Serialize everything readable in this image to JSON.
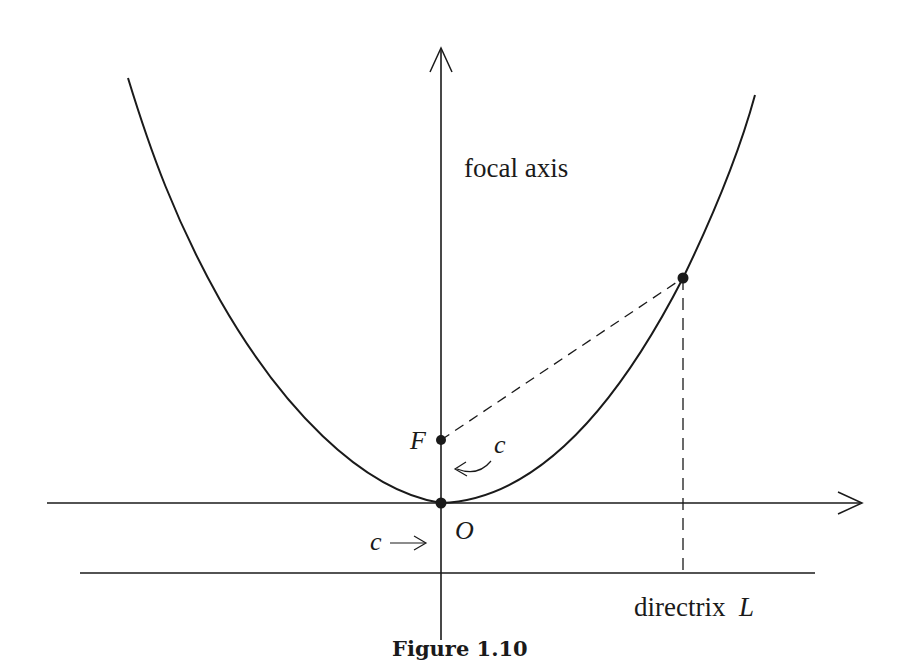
{
  "figure": {
    "caption": "Figure 1.10",
    "labels": {
      "focal_axis": "focal axis",
      "focus": "F",
      "origin": "O",
      "directrix": "directrix",
      "directrix_symbol": "L",
      "distance_upper": "c",
      "distance_lower": "c"
    },
    "colors": {
      "ink": "#1a1a1a",
      "background": "#ffffff"
    },
    "elements": {
      "curve": "parabola opening upward with vertex at O",
      "focus_point": "F on focal axis, distance c above O",
      "directrix_line": "horizontal line L, distance c below O",
      "sample_point": "point P on parabola joined to F and dropped vertically to directrix by dashed lines"
    }
  }
}
